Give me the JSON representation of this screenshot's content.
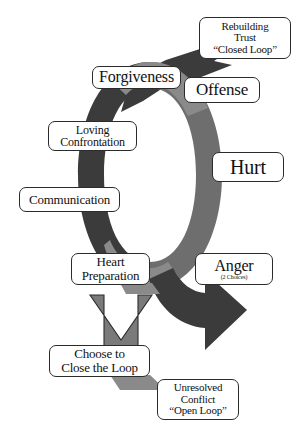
{
  "diagram": {
    "type": "cycle-flow-diagram",
    "colors": {
      "dark_gray": "#3b3b3b",
      "medium_gray": "#6e6e6e",
      "light_gray": "#8a8a8a",
      "outline": "#2b2b2b",
      "label_fill": "#ffffff",
      "background": "#ffffff"
    },
    "labels": {
      "rebuilding_trust": {
        "line1": "Rebuilding",
        "line2": "Trust",
        "line3": "“Closed Loop”"
      },
      "forgiveness": {
        "line1": "Forgiveness"
      },
      "offense": {
        "line1": "Offense"
      },
      "loving_confrontation": {
        "line1": "Loving",
        "line2": "Confrontation"
      },
      "hurt": {
        "line1": "Hurt"
      },
      "communication": {
        "line1": "Communication"
      },
      "heart_preparation": {
        "line1": "Heart",
        "line2": "Preparation"
      },
      "anger": {
        "line1": "Anger",
        "sub": "(2 Choices)"
      },
      "choose_to_close": {
        "line1": "Choose to",
        "line2": "Close the Loop"
      },
      "unresolved_conflict": {
        "line1": "Unresolved",
        "line2": "Conflict",
        "line3": "“Open Loop”"
      }
    }
  }
}
